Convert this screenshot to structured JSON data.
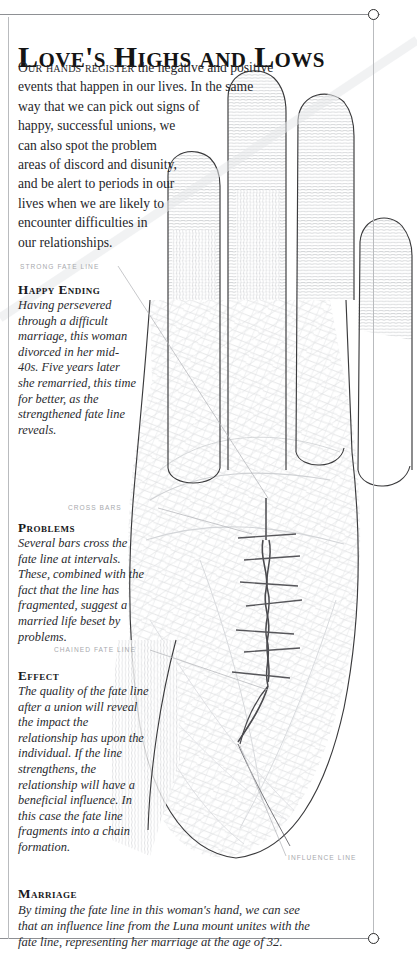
{
  "page": {
    "title": "Love's Highs and Lows",
    "intro": {
      "lead": "Our hands register",
      "line1": " the negative and positive",
      "line2": "events that happen in our lives. In the same",
      "line3": "way that we can pick out signs of",
      "line4": "happy, successful unions, we",
      "line5": "can also spot the problem",
      "line6": "areas of discord and disunity,",
      "line7": "and be alert to periods in our",
      "line8": "lives when we are likely to",
      "line9": "encounter difficulties in",
      "line10": "our relationships."
    }
  },
  "callouts": {
    "strong_fate_line": "Strong fate line",
    "cross_bars": "Cross bars",
    "chained_fate_line": "Chained fate line",
    "influence_line": "Influence line"
  },
  "notes": {
    "happy_ending": {
      "heading": "Happy Ending",
      "body": "Having persevered through a difficult marriage, this woman divorced in her mid-40s. Five years later she remarried, this time for better, as the strengthened fate line reveals."
    },
    "problems": {
      "heading": "Problems",
      "body": "Several bars cross the fate line at intervals. These, combined with the fact that the line has fragmented, suggest a married life beset by problems."
    },
    "effect": {
      "heading": "Effect",
      "body": "The quality of the fate line after a union will reveal the impact the relationship has upon the individual. If the line strengthens, the relationship will have a beneficial influence. In this case the fate line fragments into a chain formation."
    },
    "marriage": {
      "heading": "Marriage",
      "body": "By timing the fate line in this woman's hand, we can see that an influence line from the Luna mount unites with the fate line, representing her marriage at the age of 32."
    }
  },
  "colors": {
    "ink": "#1a1a1a",
    "callout_grey": "#a7a9ad",
    "rule_grey": "#8e9094",
    "print_grey": "#c9cbcd"
  },
  "icons": {
    "corner_dot_top_right": "circle-icon",
    "corner_dot_bottom_right": "circle-icon"
  }
}
